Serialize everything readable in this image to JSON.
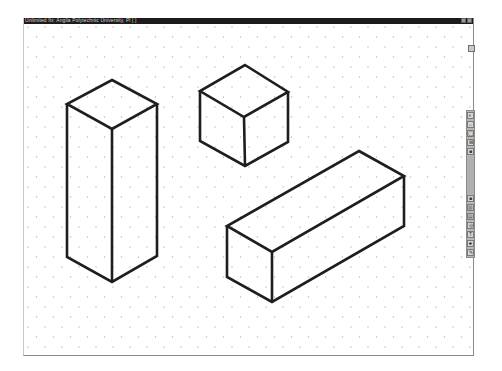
{
  "window": {
    "title": "Unlimited fix: Anglia Polytechnic University, Pl [ ]",
    "buttons": [
      "minimize",
      "maximize",
      "close"
    ]
  },
  "canvas": {
    "background": "#ffffff",
    "grid": {
      "type": "isometric-dots",
      "dot_color": "#b4b4b4",
      "spacing_x": 17,
      "spacing_y": 10
    },
    "stroke_color": "#1e1e1e",
    "shapes": [
      {
        "name": "tall-box",
        "type": "isometric-prism"
      },
      {
        "name": "cube",
        "type": "isometric-cube"
      },
      {
        "name": "long-box",
        "type": "isometric-prism"
      }
    ]
  },
  "side_panel": {
    "small_button_icon": "square-icon"
  },
  "toolbar": {
    "top_tools": [
      "select-icon",
      "rotate-icon",
      "shape-icon",
      "grid-icon",
      "fill-icon"
    ],
    "bottom_tools": [
      "fill-icon",
      "layers-icon",
      "list-icon",
      "circle-icon",
      "text-icon",
      "stamp-icon",
      "pencil-icon"
    ],
    "top_glyphs": [
      "◐",
      "⇔",
      "◯",
      "⊠",
      "■"
    ],
    "bottom_glyphs": [
      "■",
      "▥",
      "▤",
      "◎",
      "T",
      "♣",
      "✎"
    ]
  }
}
